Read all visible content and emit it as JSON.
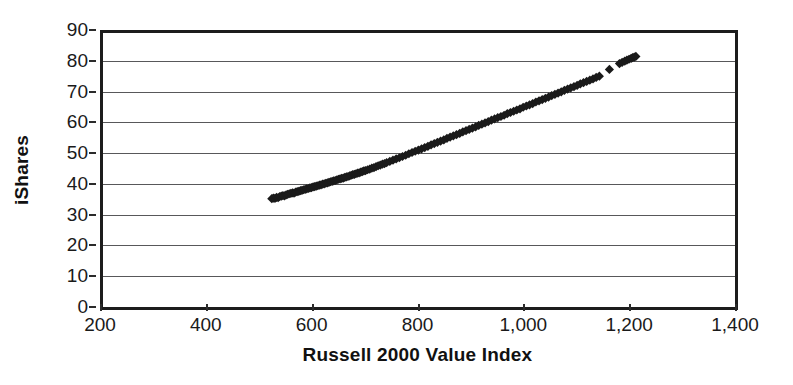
{
  "chart_data": {
    "type": "scatter",
    "title": "",
    "xlabel": "Russell 2000 Value Index",
    "ylabel": "iShares",
    "xlim": [
      200,
      1400
    ],
    "ylim": [
      0,
      90
    ],
    "grid": "horizontal",
    "legend": "none",
    "marker": "diamond",
    "marker_color": "#1a1a1a",
    "xticks": [
      200,
      400,
      600,
      800,
      1000,
      1200,
      1400
    ],
    "xtick_labels": [
      "200",
      "400",
      "600",
      "800",
      "1,000",
      "1,200",
      "1,400"
    ],
    "yticks": [
      0,
      10,
      20,
      30,
      40,
      50,
      60,
      70,
      80,
      90
    ],
    "ytick_labels": [
      "0",
      "10",
      "20",
      "30",
      "40",
      "50",
      "60",
      "70",
      "80",
      "90"
    ],
    "series": [
      {
        "name": "iShares vs Russell 2000 Value Index",
        "points": [
          [
            519,
            35.2
          ],
          [
            522,
            35.4
          ],
          [
            525,
            35.3
          ],
          [
            528,
            35.6
          ],
          [
            531,
            35.5
          ],
          [
            534,
            35.9
          ],
          [
            537,
            36.0
          ],
          [
            540,
            36.2
          ],
          [
            543,
            36.1
          ],
          [
            546,
            36.4
          ],
          [
            549,
            36.6
          ],
          [
            552,
            36.8
          ],
          [
            555,
            36.9
          ],
          [
            558,
            37.1
          ],
          [
            561,
            37.0
          ],
          [
            564,
            37.3
          ],
          [
            567,
            37.5
          ],
          [
            570,
            37.6
          ],
          [
            573,
            37.8
          ],
          [
            576,
            37.9
          ],
          [
            579,
            38.1
          ],
          [
            582,
            38.2
          ],
          [
            585,
            38.4
          ],
          [
            588,
            38.5
          ],
          [
            591,
            38.7
          ],
          [
            594,
            38.8
          ],
          [
            597,
            39.0
          ],
          [
            600,
            39.1
          ],
          [
            603,
            39.3
          ],
          [
            606,
            39.4
          ],
          [
            609,
            39.6
          ],
          [
            612,
            39.7
          ],
          [
            615,
            39.9
          ],
          [
            618,
            40.0
          ],
          [
            621,
            40.2
          ],
          [
            624,
            40.3
          ],
          [
            627,
            40.5
          ],
          [
            630,
            40.7
          ],
          [
            633,
            40.8
          ],
          [
            636,
            41.0
          ],
          [
            639,
            41.1
          ],
          [
            642,
            41.3
          ],
          [
            645,
            41.5
          ],
          [
            648,
            41.6
          ],
          [
            651,
            41.8
          ],
          [
            654,
            41.9
          ],
          [
            657,
            42.1
          ],
          [
            660,
            42.3
          ],
          [
            663,
            42.4
          ],
          [
            666,
            42.6
          ],
          [
            669,
            42.8
          ],
          [
            672,
            43.0
          ],
          [
            675,
            43.1
          ],
          [
            678,
            43.3
          ],
          [
            681,
            43.5
          ],
          [
            684,
            43.6
          ],
          [
            687,
            43.8
          ],
          [
            690,
            44.0
          ],
          [
            693,
            44.2
          ],
          [
            696,
            44.3
          ],
          [
            700,
            44.6
          ],
          [
            704,
            44.8
          ],
          [
            708,
            45.1
          ],
          [
            712,
            45.3
          ],
          [
            716,
            45.6
          ],
          [
            720,
            45.9
          ],
          [
            724,
            46.1
          ],
          [
            728,
            46.4
          ],
          [
            732,
            46.6
          ],
          [
            736,
            46.9
          ],
          [
            742,
            47.3
          ],
          [
            748,
            47.7
          ],
          [
            754,
            48.1
          ],
          [
            760,
            48.5
          ],
          [
            766,
            48.9
          ],
          [
            772,
            49.3
          ],
          [
            778,
            49.8
          ],
          [
            784,
            50.2
          ],
          [
            790,
            50.6
          ],
          [
            796,
            51.0
          ],
          [
            802,
            51.4
          ],
          [
            808,
            51.8
          ],
          [
            814,
            52.2
          ],
          [
            820,
            52.7
          ],
          [
            826,
            53.1
          ],
          [
            832,
            53.5
          ],
          [
            838,
            53.9
          ],
          [
            844,
            54.3
          ],
          [
            850,
            54.8
          ],
          [
            856,
            55.2
          ],
          [
            862,
            55.6
          ],
          [
            868,
            56.0
          ],
          [
            874,
            56.4
          ],
          [
            880,
            56.9
          ],
          [
            886,
            57.3
          ],
          [
            892,
            57.7
          ],
          [
            898,
            58.1
          ],
          [
            904,
            58.5
          ],
          [
            910,
            59.0
          ],
          [
            916,
            59.4
          ],
          [
            922,
            59.8
          ],
          [
            928,
            60.2
          ],
          [
            934,
            60.7
          ],
          [
            940,
            61.1
          ],
          [
            946,
            61.5
          ],
          [
            952,
            61.9
          ],
          [
            958,
            62.3
          ],
          [
            964,
            62.8
          ],
          [
            970,
            63.2
          ],
          [
            976,
            63.6
          ],
          [
            982,
            64.0
          ],
          [
            988,
            64.4
          ],
          [
            994,
            64.9
          ],
          [
            1000,
            65.3
          ],
          [
            1006,
            65.7
          ],
          [
            1012,
            66.1
          ],
          [
            1018,
            66.6
          ],
          [
            1024,
            67.0
          ],
          [
            1030,
            67.4
          ],
          [
            1036,
            67.8
          ],
          [
            1042,
            68.2
          ],
          [
            1048,
            68.7
          ],
          [
            1054,
            69.1
          ],
          [
            1060,
            69.5
          ],
          [
            1066,
            69.9
          ],
          [
            1072,
            70.4
          ],
          [
            1078,
            70.8
          ],
          [
            1084,
            71.2
          ],
          [
            1090,
            71.6
          ],
          [
            1096,
            72.0
          ],
          [
            1102,
            72.5
          ],
          [
            1108,
            72.9
          ],
          [
            1114,
            73.3
          ],
          [
            1120,
            73.7
          ],
          [
            1126,
            74.1
          ],
          [
            1132,
            74.6
          ],
          [
            1138,
            75.0
          ],
          [
            1157,
            77.2
          ],
          [
            1176,
            79.1
          ],
          [
            1181,
            79.5
          ],
          [
            1186,
            79.9
          ],
          [
            1190,
            80.2
          ],
          [
            1194,
            80.5
          ],
          [
            1198,
            80.8
          ],
          [
            1201,
            81.0
          ],
          [
            1204,
            81.2
          ],
          [
            1207,
            81.4
          ]
        ]
      }
    ]
  }
}
